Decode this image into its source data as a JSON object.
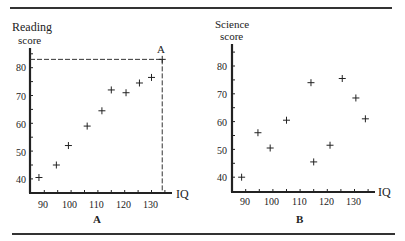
{
  "chart_data": [
    {
      "type": "scatter",
      "panel_label": "A",
      "title": "",
      "xlabel": "IQ",
      "ylabel_line1": "Reading",
      "ylabel_line2": "score",
      "xlim": [
        85,
        137
      ],
      "ylim": [
        35,
        87
      ],
      "x_ticks": [
        90,
        100,
        110,
        120,
        130
      ],
      "y_ticks": [
        40,
        50,
        60,
        70,
        80
      ],
      "marker": "+",
      "grid": false,
      "points": [
        {
          "x": 88,
          "y": 40.5
        },
        {
          "x": 94.5,
          "y": 45
        },
        {
          "x": 99,
          "y": 52
        },
        {
          "x": 106,
          "y": 59
        },
        {
          "x": 111.5,
          "y": 64.5
        },
        {
          "x": 115,
          "y": 72
        },
        {
          "x": 120.5,
          "y": 71
        },
        {
          "x": 125.5,
          "y": 74.5
        },
        {
          "x": 130,
          "y": 76.5
        }
      ],
      "highlight_point": {
        "label": "A",
        "x": 134,
        "y": 83,
        "dashed_guides": true
      }
    },
    {
      "type": "scatter",
      "panel_label": "B",
      "title": "",
      "xlabel": "IQ",
      "ylabel_line1": "Science",
      "ylabel_line2": "score",
      "xlim": [
        85,
        137
      ],
      "ylim": [
        35,
        87
      ],
      "x_ticks": [
        90,
        100,
        110,
        120,
        130
      ],
      "y_ticks": [
        40,
        50,
        60,
        70,
        80
      ],
      "marker": "+",
      "grid": false,
      "points": [
        {
          "x": 88.5,
          "y": 40
        },
        {
          "x": 94.5,
          "y": 56
        },
        {
          "x": 99,
          "y": 50.5
        },
        {
          "x": 105,
          "y": 60.5
        },
        {
          "x": 114,
          "y": 74
        },
        {
          "x": 115,
          "y": 45.5
        },
        {
          "x": 121,
          "y": 51.5
        },
        {
          "x": 125.5,
          "y": 75.5
        },
        {
          "x": 130.5,
          "y": 68.5
        },
        {
          "x": 134,
          "y": 61
        }
      ]
    }
  ],
  "panels": {
    "a": {
      "ylabel1": "Reading",
      "ylabel2": "score",
      "xlabel": "IQ",
      "letter": "A",
      "point_label": "A",
      "yticks": [
        "80",
        "70",
        "60",
        "50",
        "40"
      ],
      "xticks": [
        "90",
        "100",
        "110",
        "120",
        "130"
      ]
    },
    "b": {
      "ylabel1": "Science",
      "ylabel2": "score",
      "xlabel": "IQ",
      "letter": "B",
      "yticks": [
        "80",
        "70",
        "60",
        "50",
        "40"
      ],
      "xticks": [
        "90",
        "100",
        "110",
        "120",
        "130"
      ]
    }
  }
}
